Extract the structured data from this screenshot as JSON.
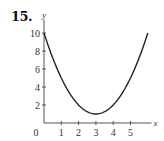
{
  "problem": {
    "number": "15."
  },
  "chart_data": {
    "type": "line",
    "title": "",
    "xlabel": "x",
    "ylabel": "y",
    "function": "y = (x - 3)^2 + 1",
    "x": [
      0,
      0.5,
      1,
      1.5,
      2,
      2.5,
      3,
      3.5,
      4,
      4.5,
      5,
      5.5,
      6
    ],
    "series": [
      {
        "name": "curve",
        "values": [
          10,
          7.25,
          5,
          3.25,
          2,
          1.25,
          1,
          1.25,
          2,
          3.25,
          5,
          7.25,
          10
        ]
      }
    ],
    "xticks": [
      "1",
      "2",
      "3",
      "4",
      "5"
    ],
    "xtick_values": [
      1,
      2,
      3,
      4,
      5
    ],
    "yticks": [
      "2",
      "4",
      "6",
      "8",
      "10"
    ],
    "ytick_values": [
      2,
      4,
      6,
      8,
      10
    ],
    "origin_label": "0",
    "xlim": [
      0,
      6.1
    ],
    "ylim": [
      0,
      11.5
    ],
    "grid": false,
    "legend": null,
    "line_color": "#222222"
  }
}
